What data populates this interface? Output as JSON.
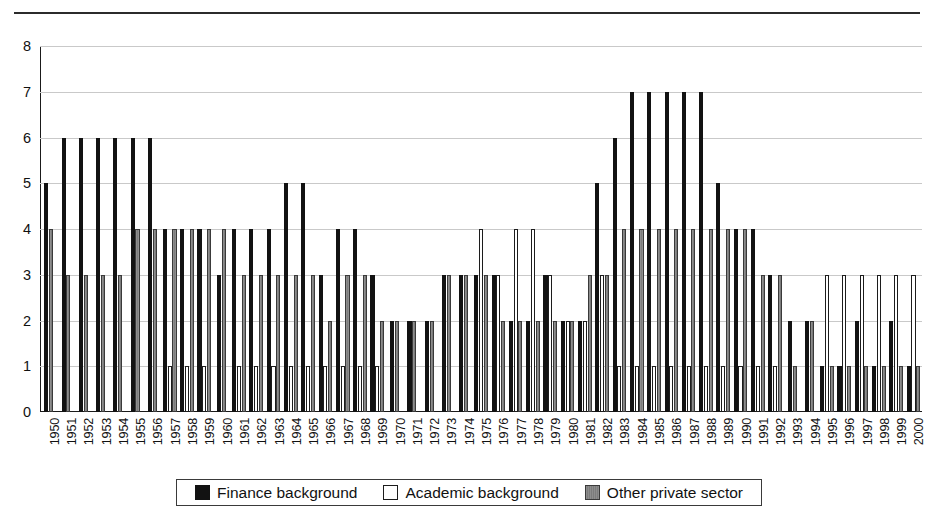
{
  "chart_data": {
    "type": "bar",
    "title": "",
    "subtitle": "",
    "xlabel": "",
    "ylabel": "",
    "ylim": [
      0,
      8
    ],
    "yticks": [
      "0",
      "1",
      "2",
      "3",
      "4",
      "5",
      "6",
      "7",
      "8"
    ],
    "grid": true,
    "legend_position": "bottom-center",
    "categories": [
      "1950",
      "1951",
      "1952",
      "1953",
      "1954",
      "1955",
      "1956",
      "1957",
      "1958",
      "1959",
      "1960",
      "1961",
      "1962",
      "1963",
      "1964",
      "1965",
      "1966",
      "1967",
      "1968",
      "1969",
      "1970",
      "1971",
      "1972",
      "1973",
      "1974",
      "1975",
      "1976",
      "1977",
      "1978",
      "1979",
      "1980",
      "1981",
      "1982",
      "1983",
      "1984",
      "1985",
      "1986",
      "1987",
      "1988",
      "1989",
      "1990",
      "1991",
      "1992",
      "1993",
      "1994",
      "1995",
      "1996",
      "1997",
      "1998",
      "1999",
      "2000"
    ],
    "series": [
      {
        "name": "Finance background",
        "color": "#121212",
        "values": [
          5,
          6,
          6,
          6,
          6,
          6,
          6,
          4,
          4,
          4,
          3,
          4,
          4,
          4,
          5,
          5,
          3,
          4,
          4,
          3,
          2,
          2,
          2,
          3,
          3,
          3,
          3,
          2,
          2,
          3,
          2,
          2,
          5,
          6,
          7,
          7,
          7,
          7,
          7,
          5,
          4,
          4,
          3,
          2,
          2,
          1,
          1,
          2,
          1,
          2,
          1
        ]
      },
      {
        "name": "Academic background",
        "color": "#ffffff",
        "values": [
          0,
          0,
          0,
          0,
          0,
          0,
          0,
          1,
          1,
          1,
          0,
          1,
          1,
          1,
          1,
          1,
          1,
          1,
          1,
          1,
          0,
          0,
          0,
          0,
          0,
          4,
          3,
          4,
          4,
          3,
          2,
          2,
          3,
          1,
          1,
          1,
          1,
          1,
          1,
          1,
          1,
          1,
          1,
          0,
          0,
          3,
          3,
          3,
          3,
          3,
          3
        ]
      },
      {
        "name": "Other private sector",
        "color": "#8a8a8a",
        "values": [
          4,
          3,
          3,
          3,
          3,
          4,
          4,
          4,
          4,
          4,
          4,
          3,
          3,
          3,
          3,
          3,
          2,
          3,
          3,
          2,
          2,
          2,
          2,
          3,
          3,
          3,
          2,
          2,
          2,
          2,
          2,
          3,
          3,
          4,
          4,
          4,
          4,
          4,
          4,
          4,
          4,
          3,
          3,
          1,
          2,
          1,
          1,
          1,
          1,
          1,
          1
        ]
      }
    ]
  },
  "legend": {
    "items": [
      {
        "label": "Finance background",
        "swatch": "finance"
      },
      {
        "label": "Academic background",
        "swatch": "academic"
      },
      {
        "label": "Other private sector",
        "swatch": "other"
      }
    ]
  }
}
